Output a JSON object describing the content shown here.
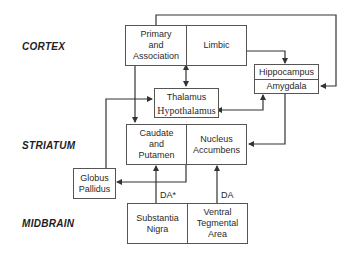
{
  "regions": {
    "cortex": "CORTEX",
    "striatum": "STRIATUM",
    "midbrain": "MIDBRAIN"
  },
  "boxes": {
    "cortex": {
      "left": "Primary\nand\nAssociation",
      "right": "Limbic"
    },
    "thalamus": {
      "line1": "Thalamus",
      "line2": "Hypothalamus"
    },
    "hippocampus": {
      "top": "Hippocampus",
      "bottom": "Amygdala"
    },
    "striatum": {
      "left": "Caudate\nand\nPutamen",
      "right": "Nucleus\nAccumbens"
    },
    "globus_pallidus": {
      "label": "Globus\nPallidus"
    },
    "midbrain": {
      "left": "Substantia\nNigra",
      "right": "Ventral\nTegmental\nArea"
    }
  },
  "connection_labels": {
    "sn_to_caudate": "DA*",
    "vta_to_accumbens": "DA"
  },
  "colors": {
    "line": "#333333",
    "border": "#555555",
    "text": "#2a2a2a"
  }
}
